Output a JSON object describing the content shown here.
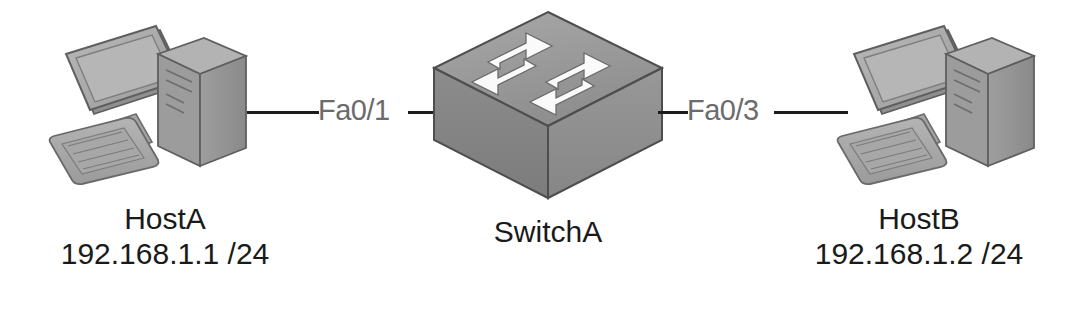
{
  "diagram": {
    "background_color": "#ffffff",
    "text_color": "#1a1a1a",
    "link_label_color": "#6b6b6b",
    "link_line_color": "#1c1c1c"
  },
  "nodes": {
    "host_a": {
      "icon": "desktop-computer-icon",
      "name": "HostA",
      "address": "192.168.1.1 /24"
    },
    "switch_a": {
      "icon": "switch-icon",
      "name": "SwitchA"
    },
    "host_b": {
      "icon": "desktop-computer-icon",
      "name": "HostB",
      "address": "192.168.1.2 /24"
    }
  },
  "links": [
    {
      "id": "link-a",
      "from": "host_a",
      "to": "switch_a",
      "label": "Fa0/1"
    },
    {
      "id": "link-b",
      "from": "switch_a",
      "to": "host_b",
      "label": "Fa0/3"
    }
  ]
}
